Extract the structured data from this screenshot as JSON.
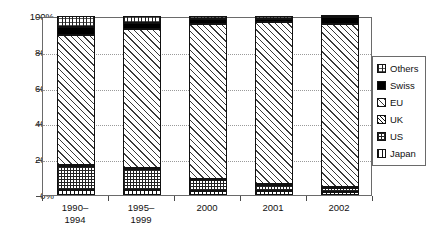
{
  "chart_data": {
    "type": "bar",
    "subtype": "stacked-percent",
    "title": "",
    "xlabel": "",
    "ylabel": "",
    "ylim": [
      0,
      100
    ],
    "ytick_labels": [
      "0%",
      "20%",
      "40%",
      "60%",
      "80%",
      "100%"
    ],
    "ytick_values": [
      0,
      20,
      40,
      60,
      80,
      100
    ],
    "grid": true,
    "grid_axis": "y",
    "legend_position": "right",
    "categories": [
      "1990–\n1994",
      "1995–\n1999",
      "2000",
      "2001",
      "2002"
    ],
    "category_labels": [
      [
        "1990–",
        "1994"
      ],
      [
        "1995–",
        "1999"
      ],
      [
        "2000",
        ""
      ],
      [
        "2001",
        ""
      ],
      [
        "2002",
        ""
      ]
    ],
    "stack_order_bottom_to_top": [
      "Japan",
      "US",
      "UK",
      "EU",
      "Swiss",
      "Others"
    ],
    "series": [
      {
        "name": "Japan",
        "pattern": "dashed-horizontal",
        "values": [
          3.0,
          3.0,
          2.0,
          2.0,
          1.5
        ]
      },
      {
        "name": "US",
        "pattern": "fine-dotted-grid",
        "values": [
          13.0,
          11.5,
          6.5,
          3.5,
          2.5
        ]
      },
      {
        "name": "UK",
        "pattern": "dense-diagonal",
        "values": [
          0.5,
          0.5,
          0.5,
          0.5,
          0.5
        ]
      },
      {
        "name": "EU",
        "pattern": "wide-diagonal",
        "values": [
          73.0,
          77.5,
          86.5,
          90.5,
          91.0
        ]
      },
      {
        "name": "Swiss",
        "pattern": "solid-black",
        "values": [
          4.5,
          3.5,
          3.0,
          2.0,
          4.0
        ]
      },
      {
        "name": "Others",
        "pattern": "cross-line",
        "values": [
          6.0,
          4.0,
          1.5,
          1.5,
          0.5
        ]
      }
    ]
  },
  "legend": {
    "items": [
      {
        "label": "Others",
        "swatch": "others-swatch-icon"
      },
      {
        "label": "Swiss",
        "swatch": "swiss-swatch-icon"
      },
      {
        "label": "EU",
        "swatch": "eu-swatch-icon"
      },
      {
        "label": "UK",
        "swatch": "uk-swatch-icon"
      },
      {
        "label": "US",
        "swatch": "us-swatch-icon"
      },
      {
        "label": "Japan",
        "swatch": "japan-swatch-icon"
      }
    ]
  },
  "colors": {
    "swiss": "#000000",
    "axis": "#4a4a4a",
    "frame": "#6a6a6a",
    "grid": "#9a9a9a",
    "text": "#111111",
    "background": "#ffffff"
  }
}
